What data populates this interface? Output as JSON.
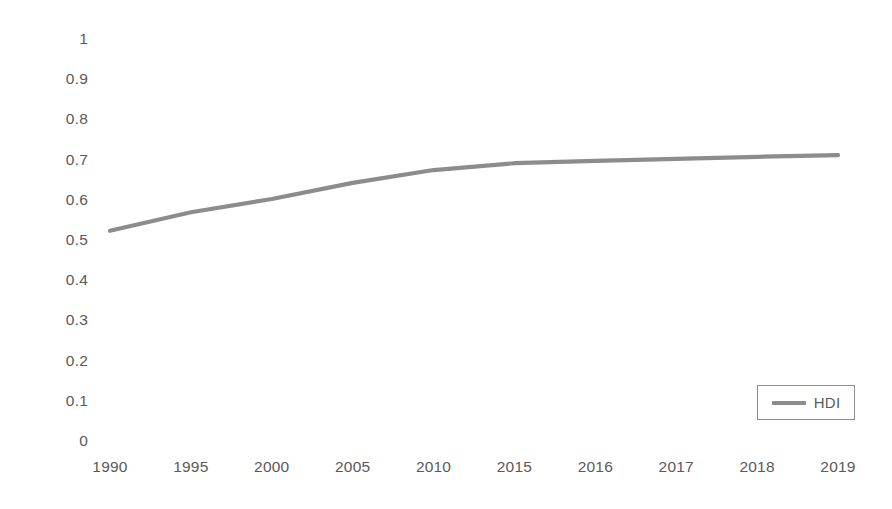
{
  "chart_data": {
    "type": "line",
    "title": "",
    "subtitle": "",
    "xlabel": "",
    "ylabel": "",
    "categories": [
      "1990",
      "1995",
      "2000",
      "2005",
      "2010",
      "2015",
      "2016",
      "2017",
      "2018",
      "2019"
    ],
    "series": [
      {
        "name": "HDI",
        "color": "#8c8c8c",
        "values": [
          0.523,
          0.569,
          0.602,
          0.642,
          0.674,
          0.691,
          0.697,
          0.702,
          0.707,
          0.711
        ]
      }
    ],
    "ylim": [
      0,
      1
    ],
    "y_ticks": [
      "0",
      "0.1",
      "0.2",
      "0.3",
      "0.4",
      "0.5",
      "0.6",
      "0.7",
      "0.8",
      "0.9",
      "1"
    ],
    "grid": false,
    "legend": {
      "position": "inside-bottom-right",
      "entries": [
        {
          "label": "HDI",
          "swatch": "line-swatch-icon",
          "color": "#8c8c8c"
        }
      ]
    },
    "axis_color": "#5a5a5a",
    "background": "#ffffff"
  }
}
